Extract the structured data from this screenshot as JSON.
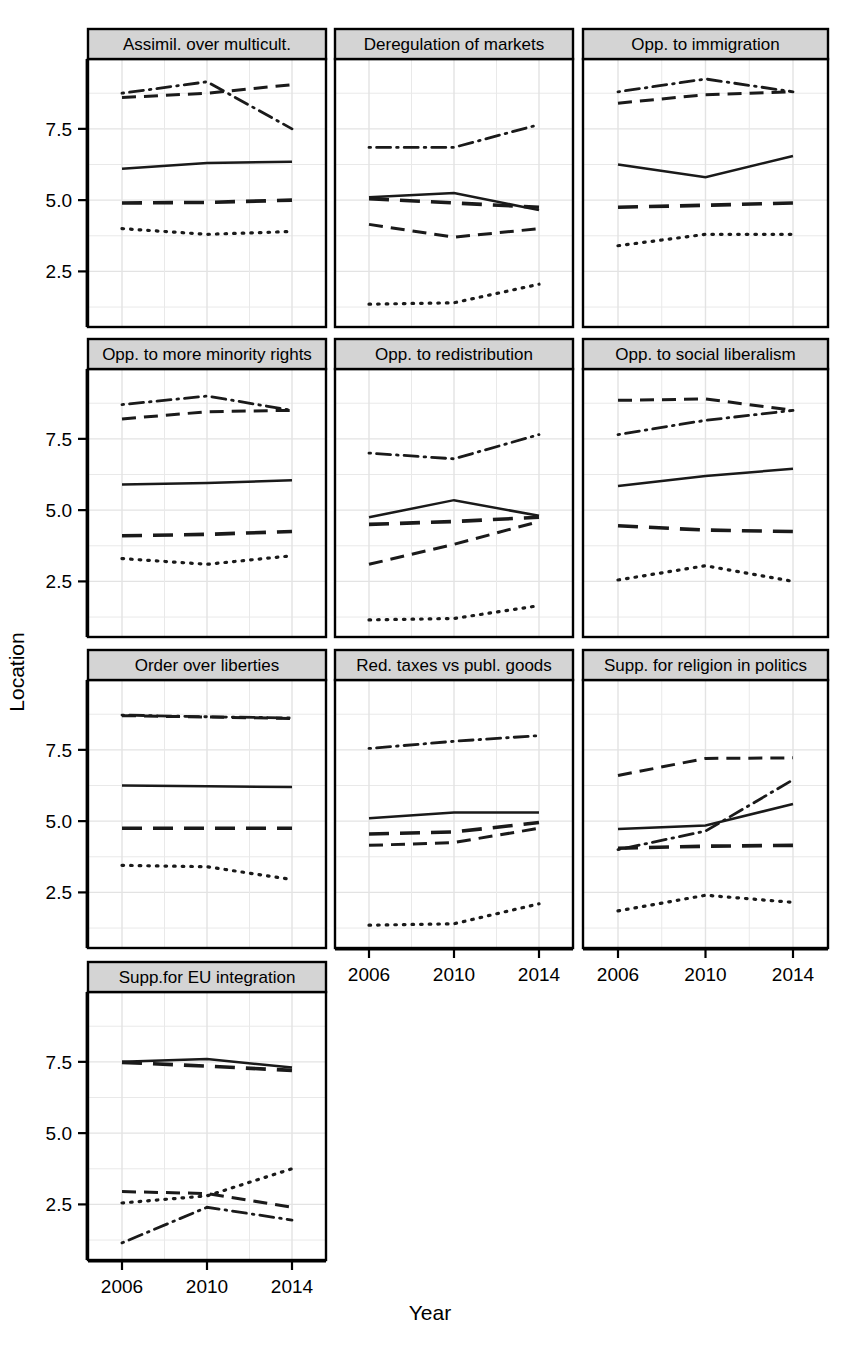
{
  "figure": {
    "ylabel": "Location",
    "xlabel": "Year",
    "y_ticks": [
      "2.5",
      "5.0",
      "7.5"
    ],
    "x_ticks": [
      "2006",
      "2010",
      "2014"
    ]
  },
  "chart_data": {
    "type": "line",
    "title": "",
    "xlabel": "Year",
    "ylabel": "Location",
    "x": [
      2006,
      2010,
      2014
    ],
    "xlim": [
      2004.4,
      2015.6
    ],
    "ylim": [
      0.55,
      9.95
    ],
    "y_ticks": [
      2.5,
      5.0,
      7.5
    ],
    "x_ticks": [
      2006,
      2010,
      2014
    ],
    "grid": true,
    "legend": "none",
    "series_styles": [
      "solid",
      "dash",
      "longdash",
      "dotted",
      "dotdash"
    ],
    "panel_layout": [
      3,
      3,
      3,
      1
    ],
    "panels": [
      {
        "title": "Assimil. over multicult.",
        "series": [
          {
            "name": "solid",
            "style": "solid",
            "values": [
              6.1,
              6.3,
              6.35
            ]
          },
          {
            "name": "dash",
            "style": "dash",
            "values": [
              8.6,
              8.75,
              9.05
            ]
          },
          {
            "name": "longdash",
            "style": "longdash",
            "values": [
              4.9,
              4.92,
              5.0
            ]
          },
          {
            "name": "dotted",
            "style": "dotted",
            "values": [
              4.0,
              3.8,
              3.9
            ]
          },
          {
            "name": "dotdash",
            "style": "dotdash",
            "values": [
              8.75,
              9.15,
              7.5
            ]
          }
        ]
      },
      {
        "title": "Deregulation of markets",
        "series": [
          {
            "name": "solid",
            "style": "solid",
            "values": [
              5.1,
              5.25,
              4.65
            ]
          },
          {
            "name": "dash",
            "style": "dash",
            "values": [
              4.15,
              3.7,
              4.0
            ]
          },
          {
            "name": "longdash",
            "style": "longdash",
            "values": [
              5.05,
              4.9,
              4.75
            ]
          },
          {
            "name": "dotted",
            "style": "dotted",
            "values": [
              1.35,
              1.4,
              2.05
            ]
          },
          {
            "name": "dotdash",
            "style": "dotdash",
            "values": [
              6.85,
              6.85,
              7.65
            ]
          }
        ]
      },
      {
        "title": "Opp. to immigration",
        "series": [
          {
            "name": "solid",
            "style": "solid",
            "values": [
              6.25,
              5.8,
              6.55
            ]
          },
          {
            "name": "dash",
            "style": "dash",
            "values": [
              8.4,
              8.7,
              8.8
            ]
          },
          {
            "name": "longdash",
            "style": "longdash",
            "values": [
              4.75,
              4.82,
              4.9
            ]
          },
          {
            "name": "dotted",
            "style": "dotted",
            "values": [
              3.4,
              3.8,
              3.8
            ]
          },
          {
            "name": "dotdash",
            "style": "dotdash",
            "values": [
              8.8,
              9.25,
              8.8
            ]
          }
        ]
      },
      {
        "title": "Opp. to more minority rights",
        "series": [
          {
            "name": "solid",
            "style": "solid",
            "values": [
              5.9,
              5.95,
              6.05
            ]
          },
          {
            "name": "dash",
            "style": "dash",
            "values": [
              8.2,
              8.45,
              8.5
            ]
          },
          {
            "name": "longdash",
            "style": "longdash",
            "values": [
              4.1,
              4.15,
              4.25
            ]
          },
          {
            "name": "dotted",
            "style": "dotted",
            "values": [
              3.3,
              3.1,
              3.4
            ]
          },
          {
            "name": "dotdash",
            "style": "dotdash",
            "values": [
              8.7,
              9.0,
              8.5
            ]
          }
        ]
      },
      {
        "title": "Opp. to redistribution",
        "series": [
          {
            "name": "solid",
            "style": "solid",
            "values": [
              4.75,
              5.35,
              4.8
            ]
          },
          {
            "name": "dash",
            "style": "dash",
            "values": [
              3.1,
              3.8,
              4.6
            ]
          },
          {
            "name": "longdash",
            "style": "longdash",
            "values": [
              4.5,
              4.6,
              4.75
            ]
          },
          {
            "name": "dotted",
            "style": "dotted",
            "values": [
              1.15,
              1.2,
              1.65
            ]
          },
          {
            "name": "dotdash",
            "style": "dotdash",
            "values": [
              7.0,
              6.8,
              7.65
            ]
          }
        ]
      },
      {
        "title": "Opp. to social liberalism",
        "series": [
          {
            "name": "solid",
            "style": "solid",
            "values": [
              5.85,
              6.2,
              6.45
            ]
          },
          {
            "name": "dash",
            "style": "dash",
            "values": [
              8.85,
              8.9,
              8.5
            ]
          },
          {
            "name": "longdash",
            "style": "longdash",
            "values": [
              4.45,
              4.3,
              4.25
            ]
          },
          {
            "name": "dotted",
            "style": "dotted",
            "values": [
              2.55,
              3.05,
              2.5
            ]
          },
          {
            "name": "dotdash",
            "style": "dotdash",
            "values": [
              7.65,
              8.15,
              8.5
            ]
          }
        ]
      },
      {
        "title": "Order over liberties",
        "series": [
          {
            "name": "solid",
            "style": "solid",
            "values": [
              6.25,
              6.22,
              6.2
            ]
          },
          {
            "name": "dash",
            "style": "dash",
            "values": [
              8.7,
              8.65,
              8.6
            ]
          },
          {
            "name": "longdash",
            "style": "longdash",
            "values": [
              4.75,
              4.75,
              4.75
            ]
          },
          {
            "name": "dotted",
            "style": "dotted",
            "values": [
              3.45,
              3.4,
              2.95
            ]
          },
          {
            "name": "dotdash",
            "style": "dotdash",
            "values": [
              8.72,
              8.66,
              8.62
            ]
          }
        ]
      },
      {
        "title": "Red. taxes vs publ. goods",
        "series": [
          {
            "name": "solid",
            "style": "solid",
            "values": [
              5.1,
              5.3,
              5.3
            ]
          },
          {
            "name": "dash",
            "style": "dash",
            "values": [
              4.15,
              4.25,
              4.75
            ]
          },
          {
            "name": "longdash",
            "style": "longdash",
            "values": [
              4.55,
              4.62,
              4.95
            ]
          },
          {
            "name": "dotted",
            "style": "dotted",
            "values": [
              1.35,
              1.4,
              2.1
            ]
          },
          {
            "name": "dotdash",
            "style": "dotdash",
            "values": [
              7.55,
              7.8,
              8.0
            ]
          }
        ]
      },
      {
        "title": "Supp. for religion in politics",
        "series": [
          {
            "name": "solid",
            "style": "solid",
            "values": [
              4.72,
              4.85,
              5.6
            ]
          },
          {
            "name": "dash",
            "style": "dash",
            "values": [
              6.6,
              7.2,
              7.22
            ]
          },
          {
            "name": "longdash",
            "style": "longdash",
            "values": [
              4.05,
              4.12,
              4.15
            ]
          },
          {
            "name": "dotted",
            "style": "dotted",
            "values": [
              1.85,
              2.4,
              2.15
            ]
          },
          {
            "name": "dotdash",
            "style": "dotdash",
            "values": [
              4.0,
              4.65,
              6.45
            ]
          }
        ]
      },
      {
        "title": "Supp.for EU integration",
        "series": [
          {
            "name": "solid",
            "style": "solid",
            "values": [
              7.5,
              7.6,
              7.3
            ]
          },
          {
            "name": "dash",
            "style": "dash",
            "values": [
              2.95,
              2.88,
              2.4
            ]
          },
          {
            "name": "longdash",
            "style": "longdash",
            "values": [
              7.48,
              7.35,
              7.2
            ]
          },
          {
            "name": "dotted",
            "style": "dotted",
            "values": [
              2.55,
              2.8,
              3.75
            ]
          },
          {
            "name": "dotdash",
            "style": "dotdash",
            "values": [
              1.15,
              2.4,
              1.95
            ]
          }
        ]
      }
    ]
  }
}
